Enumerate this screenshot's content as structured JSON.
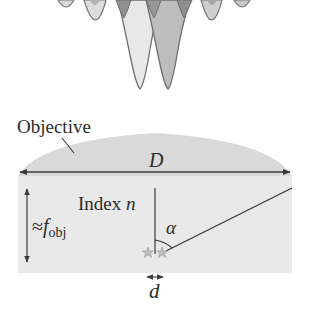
{
  "diagram": {
    "type": "optics-resolution",
    "psf": {
      "description": "Two overlapping point-spread functions (inverted intensity lobes) from two nearby emitters",
      "lobes": [
        {
          "name": "side-lobe-far-left",
          "cx": 66,
          "depth": 8
        },
        {
          "name": "side-lobe-left",
          "cx": 95,
          "depth": 20
        },
        {
          "name": "main-lobe-left",
          "cx": 140,
          "depth": 90,
          "fill": "#e6e6e6"
        },
        {
          "name": "main-lobe-right",
          "cx": 168,
          "depth": 90,
          "fill": "#bdbdbd"
        },
        {
          "name": "side-lobe-right",
          "cx": 210,
          "depth": 20
        },
        {
          "name": "side-lobe-far-right",
          "cx": 242,
          "depth": 8
        }
      ],
      "colors": {
        "outline": "#6f6f6f",
        "light_fill": "#e6e6e6",
        "dark_fill": "#b8b8b8",
        "overlap_fill": "#8c8c8c"
      }
    },
    "labels": {
      "objective": "Objective",
      "diameter": "D",
      "index_prefix": "Index ",
      "index_symbol": "n",
      "approx": "≈",
      "focal_symbol": "f",
      "focal_subscript": "obj",
      "angle": "α",
      "separation": "d"
    },
    "colors": {
      "lens_fill": "#d9d9d9",
      "medium_fill": "#e9e9e9",
      "line": "#3a3a3a",
      "text": "#2b2b2b",
      "star": "#a8a8a8"
    }
  }
}
